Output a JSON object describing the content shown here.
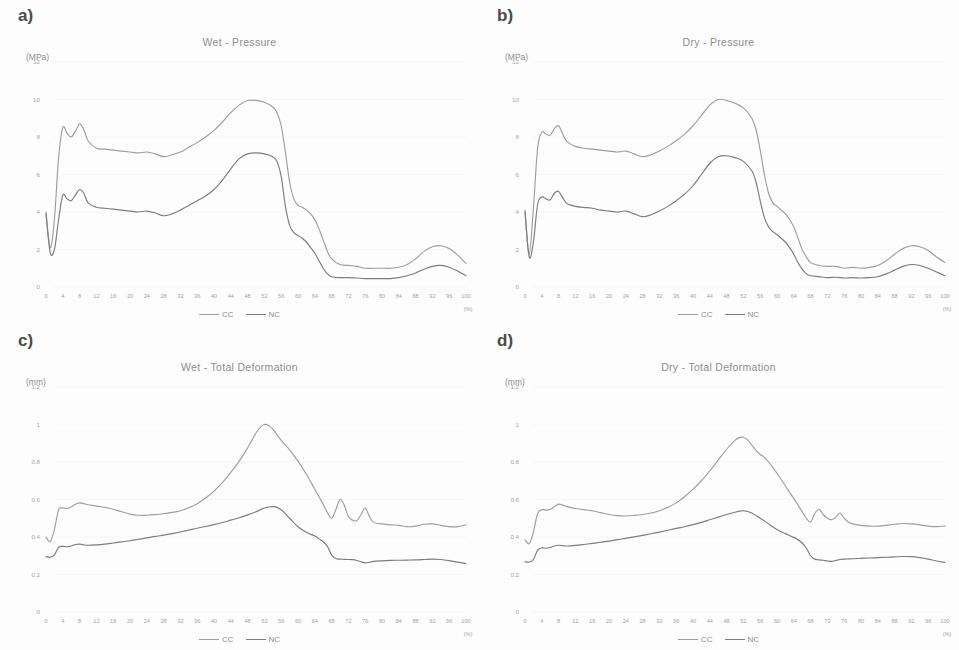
{
  "figure": {
    "caption": "",
    "x_unit": "(%)",
    "legend": [
      {
        "label": "CC",
        "color": "#9e9e9e"
      },
      {
        "label": "NC",
        "color": "#7d7d7d"
      }
    ],
    "x_ticks": [
      "0",
      "4",
      "8",
      "12",
      "16",
      "20",
      "24",
      "28",
      "32",
      "36",
      "40",
      "44",
      "48",
      "52",
      "56",
      "60",
      "64",
      "68",
      "72",
      "76",
      "80",
      "84",
      "88",
      "92",
      "96",
      "100"
    ]
  },
  "panels": [
    {
      "letter": "a)",
      "title": "Wet - Pressure",
      "y_unit": "(MPa)",
      "y_ticks": [
        "12",
        "10",
        "8",
        "6",
        "4",
        "2",
        "0"
      ]
    },
    {
      "letter": "b)",
      "title": "Dry - Pressure",
      "y_unit": "(MPa)",
      "y_ticks": [
        "12",
        "10",
        "8",
        "6",
        "4",
        "2",
        "0"
      ]
    },
    {
      "letter": "c)",
      "title": "Wet - Total Deformation",
      "y_unit": "(mm)",
      "y_ticks": [
        "1.2",
        "1",
        "0.8",
        "0.6",
        "0.4",
        "0.2",
        "0"
      ]
    },
    {
      "letter": "d)",
      "title": "Dry - Total Deformation",
      "y_unit": "(mm)",
      "y_ticks": [
        "1.2",
        "1",
        "0.8",
        "0.6",
        "0.4",
        "0.2",
        "0"
      ]
    }
  ],
  "chart_data": [
    {
      "id": "a",
      "type": "line",
      "title": "Wet - Pressure",
      "xlabel": "(%)",
      "ylabel": "(MPa)",
      "xlim": [
        0,
        100
      ],
      "ylim": [
        0,
        12
      ],
      "grid": false,
      "legend_position": "bottom-center",
      "x": [
        0,
        1,
        2,
        3,
        4,
        5,
        6,
        7,
        8,
        9,
        10,
        12,
        14,
        16,
        18,
        20,
        22,
        24,
        26,
        28,
        30,
        32,
        34,
        36,
        38,
        40,
        42,
        44,
        46,
        48,
        50,
        52,
        54,
        55,
        56,
        57,
        58,
        59,
        60,
        61,
        62,
        63,
        64,
        65,
        66,
        67,
        68,
        70,
        72,
        74,
        76,
        78,
        80,
        82,
        84,
        86,
        88,
        90,
        92,
        94,
        96,
        98,
        100
      ],
      "series": [
        {
          "name": "CC",
          "color": "#9e9e9e",
          "values": [
            4.0,
            2.1,
            3.6,
            6.9,
            8.5,
            8.2,
            8.0,
            8.3,
            8.7,
            8.4,
            7.8,
            7.4,
            7.35,
            7.3,
            7.25,
            7.2,
            7.15,
            7.2,
            7.1,
            6.95,
            7.05,
            7.2,
            7.45,
            7.7,
            8.0,
            8.35,
            8.8,
            9.3,
            9.7,
            9.95,
            9.95,
            9.85,
            9.6,
            9.3,
            8.6,
            7.2,
            5.6,
            4.7,
            4.35,
            4.25,
            4.1,
            3.9,
            3.6,
            3.1,
            2.5,
            1.9,
            1.5,
            1.2,
            1.15,
            1.1,
            1.0,
            1.0,
            1.0,
            1.0,
            1.05,
            1.2,
            1.5,
            1.9,
            2.15,
            2.2,
            2.05,
            1.7,
            1.25
          ]
        },
        {
          "name": "NC",
          "color": "#7d7d7d",
          "values": [
            3.9,
            1.85,
            2.0,
            3.6,
            4.9,
            4.7,
            4.6,
            4.9,
            5.2,
            5.0,
            4.5,
            4.25,
            4.2,
            4.15,
            4.1,
            4.05,
            4.0,
            4.05,
            3.95,
            3.8,
            3.9,
            4.1,
            4.35,
            4.6,
            4.85,
            5.2,
            5.7,
            6.3,
            6.85,
            7.1,
            7.15,
            7.1,
            6.95,
            6.7,
            5.9,
            4.3,
            3.3,
            2.9,
            2.75,
            2.6,
            2.4,
            2.1,
            1.8,
            1.4,
            1.0,
            0.7,
            0.55,
            0.5,
            0.5,
            0.48,
            0.45,
            0.45,
            0.45,
            0.45,
            0.5,
            0.6,
            0.75,
            0.95,
            1.1,
            1.15,
            1.05,
            0.85,
            0.6
          ]
        }
      ]
    },
    {
      "id": "b",
      "type": "line",
      "title": "Dry - Pressure",
      "xlabel": "(%)",
      "ylabel": "(MPa)",
      "xlim": [
        0,
        100
      ],
      "ylim": [
        0,
        12
      ],
      "grid": false,
      "legend_position": "bottom-center",
      "x": [
        0,
        1,
        2,
        3,
        4,
        5,
        6,
        7,
        8,
        9,
        10,
        12,
        14,
        16,
        18,
        20,
        22,
        24,
        26,
        28,
        30,
        32,
        34,
        36,
        38,
        40,
        42,
        44,
        46,
        48,
        50,
        52,
        54,
        55,
        56,
        57,
        58,
        59,
        60,
        61,
        62,
        63,
        64,
        65,
        66,
        67,
        68,
        70,
        72,
        74,
        76,
        78,
        80,
        82,
        84,
        86,
        88,
        90,
        92,
        94,
        96,
        98,
        100
      ],
      "series": [
        {
          "name": "CC",
          "color": "#9e9e9e",
          "values": [
            4.1,
            1.75,
            4.2,
            7.4,
            8.25,
            8.15,
            8.1,
            8.45,
            8.6,
            8.15,
            7.75,
            7.5,
            7.4,
            7.35,
            7.3,
            7.25,
            7.2,
            7.25,
            7.1,
            6.95,
            7.05,
            7.25,
            7.5,
            7.8,
            8.15,
            8.6,
            9.15,
            9.7,
            10.0,
            9.95,
            9.8,
            9.55,
            9.0,
            8.4,
            7.3,
            6.0,
            5.0,
            4.5,
            4.3,
            4.1,
            3.9,
            3.6,
            3.2,
            2.6,
            2.0,
            1.6,
            1.3,
            1.15,
            1.1,
            1.1,
            1.0,
            1.05,
            1.0,
            1.05,
            1.15,
            1.4,
            1.75,
            2.05,
            2.2,
            2.15,
            1.95,
            1.6,
            1.3
          ]
        },
        {
          "name": "NC",
          "color": "#7d7d7d",
          "values": [
            4.0,
            1.6,
            2.4,
            4.4,
            4.8,
            4.7,
            4.65,
            5.0,
            5.1,
            4.75,
            4.45,
            4.3,
            4.25,
            4.2,
            4.1,
            4.05,
            4.0,
            4.05,
            3.9,
            3.75,
            3.85,
            4.05,
            4.3,
            4.6,
            4.95,
            5.4,
            6.0,
            6.6,
            6.95,
            7.0,
            6.9,
            6.7,
            6.2,
            5.6,
            4.6,
            3.7,
            3.2,
            2.95,
            2.8,
            2.6,
            2.4,
            2.1,
            1.75,
            1.3,
            0.95,
            0.7,
            0.6,
            0.55,
            0.5,
            0.52,
            0.48,
            0.5,
            0.48,
            0.5,
            0.55,
            0.7,
            0.9,
            1.1,
            1.2,
            1.15,
            1.0,
            0.8,
            0.6
          ]
        }
      ]
    },
    {
      "id": "c",
      "type": "line",
      "title": "Wet - Total Deformation",
      "xlabel": "(%)",
      "ylabel": "(mm)",
      "xlim": [
        0,
        100
      ],
      "ylim": [
        0,
        1.2
      ],
      "grid": false,
      "legend_position": "bottom-center",
      "x": [
        0,
        1,
        2,
        3,
        4,
        5,
        6,
        7,
        8,
        9,
        10,
        12,
        14,
        16,
        18,
        20,
        22,
        24,
        26,
        28,
        30,
        32,
        34,
        36,
        38,
        40,
        42,
        44,
        46,
        48,
        50,
        51,
        52,
        53,
        54,
        55,
        56,
        57,
        58,
        60,
        62,
        64,
        65,
        66,
        67,
        68,
        69,
        70,
        71,
        72,
        73,
        74,
        75,
        76,
        77,
        78,
        80,
        82,
        84,
        86,
        88,
        90,
        92,
        94,
        96,
        98,
        100
      ],
      "series": [
        {
          "name": "CC",
          "color": "#9e9e9e",
          "values": [
            0.4,
            0.375,
            0.44,
            0.545,
            0.555,
            0.552,
            0.56,
            0.575,
            0.582,
            0.578,
            0.572,
            0.565,
            0.558,
            0.548,
            0.535,
            0.522,
            0.516,
            0.516,
            0.519,
            0.524,
            0.531,
            0.54,
            0.556,
            0.578,
            0.608,
            0.645,
            0.69,
            0.745,
            0.805,
            0.875,
            0.955,
            0.985,
            1.0,
            0.995,
            0.975,
            0.945,
            0.915,
            0.89,
            0.865,
            0.805,
            0.735,
            0.655,
            0.615,
            0.575,
            0.53,
            0.5,
            0.545,
            0.6,
            0.57,
            0.51,
            0.49,
            0.487,
            0.52,
            0.555,
            0.51,
            0.478,
            0.47,
            0.465,
            0.462,
            0.455,
            0.458,
            0.468,
            0.47,
            0.462,
            0.455,
            0.455,
            0.465
          ]
        },
        {
          "name": "NC",
          "color": "#7d7d7d",
          "values": [
            0.295,
            0.292,
            0.305,
            0.345,
            0.35,
            0.348,
            0.352,
            0.36,
            0.362,
            0.358,
            0.356,
            0.358,
            0.362,
            0.368,
            0.374,
            0.38,
            0.388,
            0.395,
            0.403,
            0.41,
            0.418,
            0.427,
            0.437,
            0.447,
            0.456,
            0.466,
            0.477,
            0.49,
            0.503,
            0.518,
            0.535,
            0.545,
            0.555,
            0.56,
            0.562,
            0.558,
            0.545,
            0.525,
            0.5,
            0.455,
            0.425,
            0.405,
            0.39,
            0.375,
            0.35,
            0.305,
            0.285,
            0.282,
            0.281,
            0.28,
            0.279,
            0.275,
            0.268,
            0.262,
            0.265,
            0.27,
            0.273,
            0.275,
            0.276,
            0.277,
            0.278,
            0.28,
            0.282,
            0.28,
            0.274,
            0.266,
            0.258
          ]
        }
      ]
    },
    {
      "id": "d",
      "type": "line",
      "title": "Dry - Total Deformation",
      "xlabel": "(%)",
      "ylabel": "(mm)",
      "xlim": [
        0,
        100
      ],
      "ylim": [
        0,
        1.2
      ],
      "grid": false,
      "legend_position": "bottom-center",
      "x": [
        0,
        1,
        2,
        3,
        4,
        5,
        6,
        7,
        8,
        9,
        10,
        12,
        14,
        16,
        18,
        20,
        22,
        24,
        26,
        28,
        30,
        32,
        34,
        36,
        38,
        40,
        42,
        44,
        46,
        48,
        50,
        51,
        52,
        53,
        54,
        55,
        56,
        57,
        58,
        60,
        62,
        64,
        65,
        66,
        67,
        68,
        69,
        70,
        71,
        72,
        73,
        74,
        75,
        76,
        77,
        78,
        80,
        82,
        84,
        86,
        88,
        90,
        92,
        94,
        96,
        98,
        100
      ],
      "series": [
        {
          "name": "CC",
          "color": "#9e9e9e",
          "values": [
            0.385,
            0.365,
            0.425,
            0.525,
            0.545,
            0.543,
            0.548,
            0.562,
            0.575,
            0.57,
            0.562,
            0.552,
            0.546,
            0.54,
            0.53,
            0.52,
            0.514,
            0.512,
            0.515,
            0.52,
            0.528,
            0.54,
            0.558,
            0.582,
            0.615,
            0.655,
            0.7,
            0.752,
            0.81,
            0.868,
            0.915,
            0.93,
            0.932,
            0.918,
            0.89,
            0.862,
            0.84,
            0.825,
            0.8,
            0.74,
            0.672,
            0.605,
            0.57,
            0.535,
            0.5,
            0.48,
            0.525,
            0.548,
            0.52,
            0.5,
            0.492,
            0.505,
            0.528,
            0.5,
            0.48,
            0.47,
            0.462,
            0.458,
            0.458,
            0.462,
            0.468,
            0.472,
            0.47,
            0.465,
            0.458,
            0.455,
            0.458
          ]
        },
        {
          "name": "NC",
          "color": "#7d7d7d",
          "values": [
            0.268,
            0.266,
            0.28,
            0.33,
            0.342,
            0.34,
            0.344,
            0.352,
            0.356,
            0.354,
            0.352,
            0.355,
            0.36,
            0.366,
            0.372,
            0.378,
            0.386,
            0.393,
            0.401,
            0.409,
            0.417,
            0.426,
            0.436,
            0.446,
            0.455,
            0.466,
            0.478,
            0.492,
            0.506,
            0.52,
            0.532,
            0.538,
            0.54,
            0.536,
            0.528,
            0.515,
            0.5,
            0.486,
            0.47,
            0.44,
            0.418,
            0.398,
            0.385,
            0.368,
            0.34,
            0.3,
            0.282,
            0.278,
            0.276,
            0.272,
            0.27,
            0.275,
            0.28,
            0.282,
            0.283,
            0.284,
            0.286,
            0.288,
            0.29,
            0.292,
            0.294,
            0.296,
            0.295,
            0.29,
            0.282,
            0.272,
            0.265
          ]
        }
      ]
    }
  ]
}
